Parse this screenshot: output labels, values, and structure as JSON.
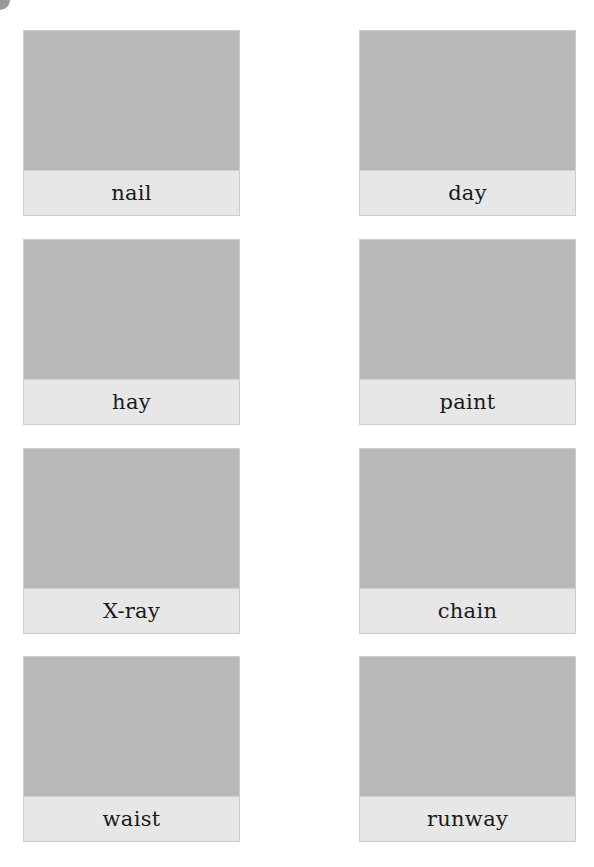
{
  "page": {
    "colors": {
      "image_placeholder": "#b8b8b8",
      "label_background": "#e7e7e7",
      "border": "#cdcdcd",
      "text": "#1a1a1a",
      "corner_mark": "#9a9a9a"
    }
  },
  "cards": [
    {
      "label": "nail"
    },
    {
      "label": "day"
    },
    {
      "label": "hay"
    },
    {
      "label": "paint"
    },
    {
      "label": "X-ray"
    },
    {
      "label": "chain"
    },
    {
      "label": "waist"
    },
    {
      "label": "runway"
    }
  ]
}
